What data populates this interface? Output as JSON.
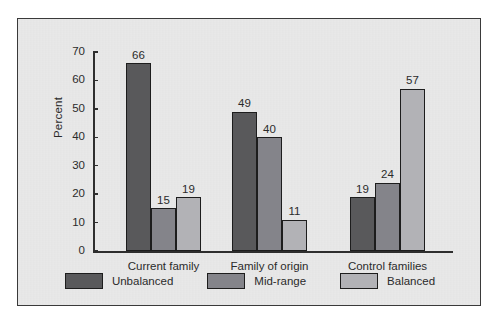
{
  "chart_data": {
    "type": "bar",
    "title": "",
    "xlabel": "",
    "ylabel": "Percent",
    "ylim": [
      0,
      70
    ],
    "yticks": [
      0,
      10,
      20,
      30,
      40,
      50,
      60,
      70
    ],
    "grid": false,
    "legend_position": "bottom",
    "categories": [
      "Current family",
      "Family of origin",
      "Control families"
    ],
    "series": [
      {
        "name": "Unbalanced",
        "color": "#59595b",
        "values": [
          66,
          49,
          19
        ]
      },
      {
        "name": "Mid-range",
        "color": "#84848a",
        "values": [
          15,
          40,
          24
        ]
      },
      {
        "name": "Balanced",
        "color": "#b2b2b6",
        "values": [
          19,
          11,
          57
        ]
      }
    ]
  },
  "figure": {
    "background": "#ffffff",
    "panel_background": "#e9e9e9",
    "panel_border": "#3a3a3a",
    "axis_color": "#2e2e2e",
    "text_color": "#2b2b2b"
  }
}
